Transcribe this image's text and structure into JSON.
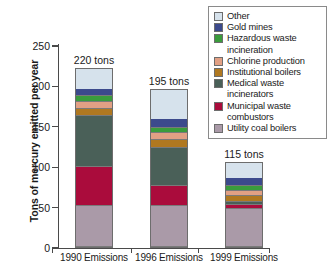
{
  "chart_data": {
    "type": "bar",
    "stacked": true,
    "title": "",
    "xlabel": "",
    "ylabel": "Tons of mercury emitted per year",
    "ylim": [
      0,
      250
    ],
    "yticks": [
      0,
      50,
      100,
      150,
      200,
      250
    ],
    "grid": false,
    "legend_position": "top-right",
    "categories": [
      "1990 Emissions",
      "1996 Emissions",
      "1999 Emissions"
    ],
    "totals": [
      220,
      195,
      115
    ],
    "total_labels": [
      "220 tons",
      "195 tons",
      "115 tons"
    ],
    "series": [
      {
        "name": "Utility coal boilers",
        "color": "#aa9aa8",
        "values": [
          51,
          51,
          48
        ]
      },
      {
        "name": "Municipal waste combustors",
        "color": "#aa0c3c",
        "values": [
          49,
          25,
          5
        ]
      },
      {
        "name": "Medical waste incinerators",
        "color": "#4a6058",
        "values": [
          64,
          48,
          4
        ]
      },
      {
        "name": "Institutional boilers",
        "color": "#b07820",
        "values": [
          9,
          10,
          7
        ]
      },
      {
        "name": "Chlorine production",
        "color": "#e2a084",
        "values": [
          9,
          9,
          7
        ]
      },
      {
        "name": "Hazardous waste incineration",
        "color": "#3a9c3c",
        "values": [
          7,
          6,
          6
        ]
      },
      {
        "name": "Gold mines",
        "color": "#3c4a8c",
        "values": [
          9,
          11,
          10
        ]
      },
      {
        "name": "Other",
        "color": "#d6e2ec",
        "values": [
          25,
          37,
          20
        ]
      }
    ]
  },
  "legend": {
    "entries": [
      {
        "label": "Other",
        "color": "#d6e2ec"
      },
      {
        "label": "Gold mines",
        "color": "#3c4a8c"
      },
      {
        "label": "Hazardous waste\nincineration",
        "color": "#3a9c3c"
      },
      {
        "label": "Chlorine production",
        "color": "#e2a084"
      },
      {
        "label": "Institutional boilers",
        "color": "#b07820"
      },
      {
        "label": "Medical waste\nincinerators",
        "color": "#4a6058"
      },
      {
        "label": "Municipal waste\ncombustors",
        "color": "#aa0c3c"
      },
      {
        "label": "Utility coal boilers",
        "color": "#aa9aa8"
      }
    ]
  },
  "axis": {
    "y_title": "Tons of mercury emitted per year",
    "y_tick_labels": [
      "0",
      "50",
      "100",
      "150",
      "200",
      "250"
    ]
  }
}
